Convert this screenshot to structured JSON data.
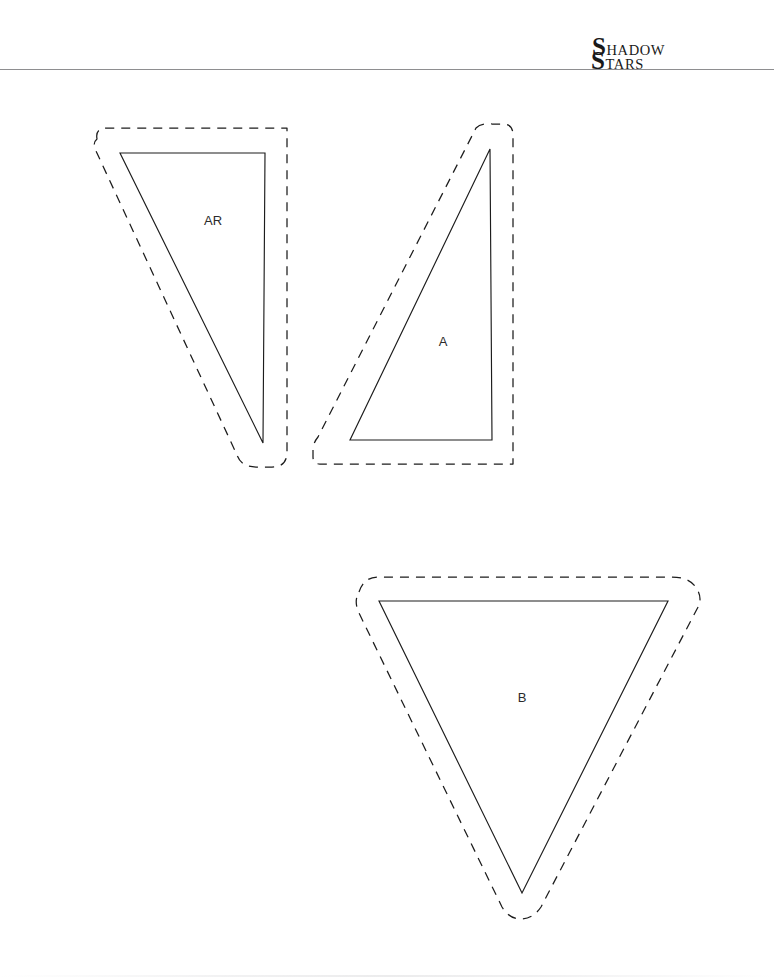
{
  "page": {
    "width": 774,
    "height": 977,
    "background_color": "#ffffff",
    "kind": "pattern-sheet"
  },
  "header": {
    "rule_color": "#8e8e90",
    "brand": {
      "line1_cap": "S",
      "line1_rest": "HADOW",
      "line2_cap": "S",
      "line2_rest": "TARS",
      "full_text": "Shadow Stars",
      "color": "#1a1a1a"
    }
  },
  "pattern": {
    "line_color": "#1c1c1c",
    "cut_line_style": "solid",
    "seam_line_style": "dashed",
    "pieces": [
      {
        "id": "piece-ar",
        "label": "AR",
        "label_x": 213,
        "label_y": 222,
        "cut_path": "M 120 153 L 265 153 L 263 443 Z",
        "seam_path": "M 97 139 Q 95 128 107 128 L 287 128 L 287 452 Q 287 467 272 467 L 256 467 Q 241 467 237 455 L 96 151 Q 92 143 97 139 Z"
      },
      {
        "id": "piece-a",
        "label": "A",
        "label_x": 443,
        "label_y": 343,
        "cut_path": "M 490 149 L 492 440 L 350 440 Z",
        "seam_path": "M 476 128 Q 481 123 492 124 L 503 124 Q 513 124 513 135 L 513 464 L 320 464 Q 313 464 313 457 L 313 450 Q 313 443 318 437 Z"
      },
      {
        "id": "piece-b",
        "label": "B",
        "label_x": 522,
        "label_y": 699,
        "cut_path": "M 379 601 L 668 601 L 522 893 Z",
        "seam_path": "M 359 592 Q 364 577 378 577 L 672 577 Q 690 577 697 589 Q 703 599 697 609 L 541 907 Q 533 919 521 919 Q 509 919 502 907 L 358 611 Q 354 600 359 592 Z"
      }
    ]
  }
}
